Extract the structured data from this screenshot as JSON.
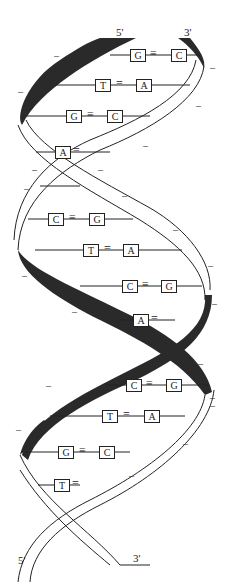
{
  "diagram": {
    "strand_ends": {
      "top_left": "5'",
      "top_right": "3'",
      "bottom_left": "5'",
      "bottom_right": "3'"
    },
    "base_pairs": [
      {
        "left": "G",
        "bond": "≡",
        "right": "C",
        "y": 55
      },
      {
        "left": "T",
        "bond": "=",
        "right": "A",
        "y": 85
      },
      {
        "left": "G",
        "bond": "≡",
        "right": "C",
        "y": 116
      },
      {
        "left": "A",
        "bond": "=",
        "right": "T",
        "y": 152
      },
      {
        "left": "T",
        "bond": "=",
        "right": "A",
        "y": 186
      },
      {
        "left": "C",
        "bond": "≡",
        "right": "G",
        "y": 219
      },
      {
        "left": "T",
        "bond": "=",
        "right": "A",
        "y": 250
      },
      {
        "left": "C",
        "bond": "≡",
        "right": "G",
        "y": 286
      },
      {
        "left": "A",
        "bond": "=",
        "right": "T",
        "y": 320
      },
      {
        "left": "C",
        "bond": "≡",
        "right": "G",
        "y": 385
      },
      {
        "left": "T",
        "bond": "=",
        "right": "A",
        "y": 416
      },
      {
        "left": "G",
        "bond": "≡",
        "right": "C",
        "y": 452
      },
      {
        "left": "T",
        "bond": "=",
        "right": "A",
        "y": 485
      }
    ],
    "phosphate_charge": "–",
    "colors": {
      "strand_dark": "#2a2a2a",
      "strand_light": "#ffffff",
      "outline": "#222222"
    }
  }
}
